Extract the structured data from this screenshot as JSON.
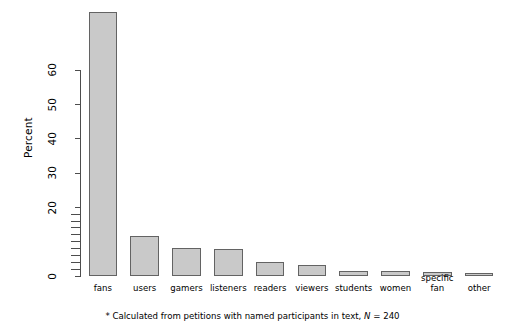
{
  "chart_data": {
    "type": "bar",
    "title": "",
    "subtitle": "",
    "xlabel": "",
    "ylabel": "Percent",
    "categories": [
      "fans",
      "users",
      "gamers",
      "listeners",
      "readers",
      "viewers",
      "students",
      "women",
      "specific fan",
      "other"
    ],
    "category_lines": [
      [
        "fans"
      ],
      [
        "users"
      ],
      [
        "gamers"
      ],
      [
        "listeners"
      ],
      [
        "readers"
      ],
      [
        "viewers"
      ],
      [
        "students"
      ],
      [
        "women"
      ],
      [
        "specific",
        "fan"
      ],
      [
        "other"
      ]
    ],
    "values": [
      77.0,
      11.7,
      8.2,
      8.0,
      4.1,
      3.2,
      1.5,
      1.4,
      1.3,
      0.9
    ],
    "ylim": [
      0,
      77
    ],
    "y_major_ticks": [
      0,
      20,
      30,
      40,
      50,
      60
    ],
    "y_major_tick_labels": [
      "0",
      "20",
      "30",
      "40",
      "50",
      "60"
    ],
    "y_minor_ticks": [
      2,
      4,
      6,
      8,
      10,
      12,
      14,
      16,
      18
    ],
    "grid": false,
    "legend": "none",
    "bar_fill_color": "#c9c9c9",
    "bar_border_color": "#636363",
    "axis_color": "#4d4d4d"
  },
  "footnote": {
    "prefix": "* Calculated from petitions with named participants in text, ",
    "italic_symbol": "N",
    "suffix": " = 240"
  }
}
